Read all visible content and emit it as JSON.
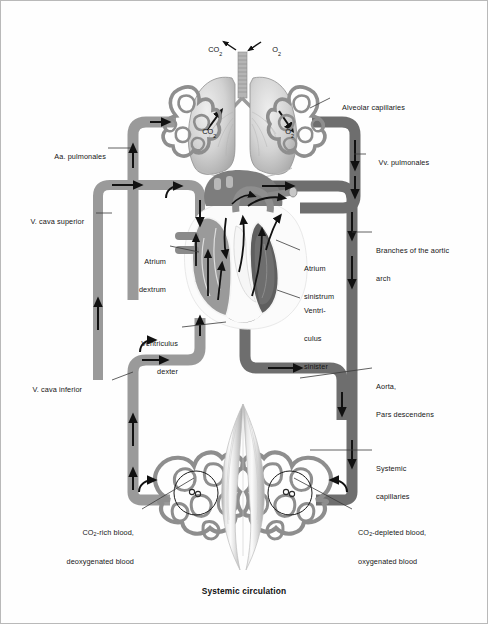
{
  "diagram": {
    "caption": "Systemic circulation",
    "title": "Systemic circulation",
    "colors": {
      "deoxygenated_vessel": "#9a9a9a",
      "oxygenated_vessel": "#6e6e6e",
      "capillary_network": "#8e8e8e",
      "muscle": "#d8d8d8",
      "arrow": "#111111",
      "leader_line": "#3a3a3a",
      "background": "#ffffff",
      "border": "#b9b9b9",
      "text": "#161616"
    }
  },
  "gas_labels": [
    {
      "name": "co2-out",
      "text": "CO",
      "sub": "2"
    },
    {
      "name": "o2-in",
      "text": "O",
      "sub": "2"
    },
    {
      "name": "co2-lung-left",
      "text": "CO",
      "sub": "2"
    },
    {
      "name": "o2-lung-right",
      "text": "O",
      "sub": "2"
    }
  ],
  "labels": {
    "left": [
      {
        "name": "aa-pulmonales",
        "line1": "Aa. pulmonales",
        "line2": ""
      },
      {
        "name": "v-cava-superior",
        "line1": "V. cava superior",
        "line2": ""
      },
      {
        "name": "atrium-dextrum",
        "line1": "Atrium",
        "line2": "dextrum"
      },
      {
        "name": "ventriculus-dexter",
        "line1": "Ventriculus",
        "line2": "dexter"
      },
      {
        "name": "v-cava-inferior",
        "line1": "V. cava inferior",
        "line2": ""
      },
      {
        "name": "co2-rich-blood",
        "line1": "CO2-rich blood,",
        "line2": "deoxygenated blood"
      }
    ],
    "right": [
      {
        "name": "alveolar-capillaries",
        "line1": "Alveolar capillaries",
        "line2": ""
      },
      {
        "name": "vv-pulmonales",
        "line1": "Vv. pulmonales",
        "line2": ""
      },
      {
        "name": "branches-aortic-arch",
        "line1": "Branches of the aortic",
        "line2": "arch"
      },
      {
        "name": "atrium-sinistrum",
        "line1": "Atrium",
        "line2": "sinistrum"
      },
      {
        "name": "ventriculus-sinister",
        "line1": "Ventri-",
        "line2": "culus",
        "line3": "sinister"
      },
      {
        "name": "aorta-pars-descendens",
        "line1": "Aorta,",
        "line2": "Pars descendens"
      },
      {
        "name": "systemic-capillaries",
        "line1": "Systemic",
        "line2": "capillaries"
      },
      {
        "name": "co2-depleted-blood",
        "line1": "CO2-depleted blood,",
        "line2": "oxygenated blood"
      }
    ]
  }
}
